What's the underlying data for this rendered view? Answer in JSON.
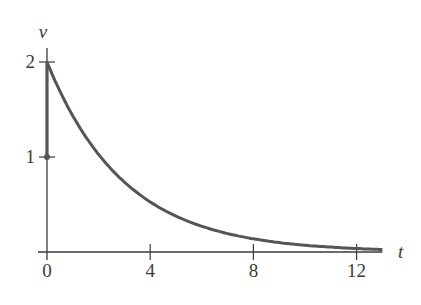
{
  "chart_data": {
    "type": "line",
    "title": "",
    "xlabel": "t",
    "ylabel": "v",
    "xlim": [
      0,
      13
    ],
    "ylim": [
      0,
      2
    ],
    "x_ticks": [
      0,
      4,
      8,
      12
    ],
    "x_tick_labels": [
      "0",
      "4",
      "8",
      "12"
    ],
    "y_ticks": [
      1,
      2
    ],
    "y_tick_labels": [
      "1",
      "2"
    ],
    "grid": false,
    "legend": null,
    "series": [
      {
        "name": "jump at t=0",
        "description": "vertical segment from v=1 to v=2 at t=0, with dot at (0,1)",
        "x": [
          0,
          0
        ],
        "y": [
          1,
          2
        ]
      },
      {
        "name": "v(t)",
        "description": "exponential decay starting at v=2",
        "x": [
          0,
          1,
          2,
          3,
          4,
          5,
          6,
          7,
          8,
          9,
          10,
          11,
          12,
          13
        ],
        "y": [
          2.0,
          1.43,
          1.03,
          0.74,
          0.53,
          0.38,
          0.27,
          0.19,
          0.14,
          0.1,
          0.07,
          0.05,
          0.04,
          0.03
        ]
      }
    ]
  },
  "colors": {
    "axis": "#3a3a3a",
    "curve": "#555555"
  }
}
